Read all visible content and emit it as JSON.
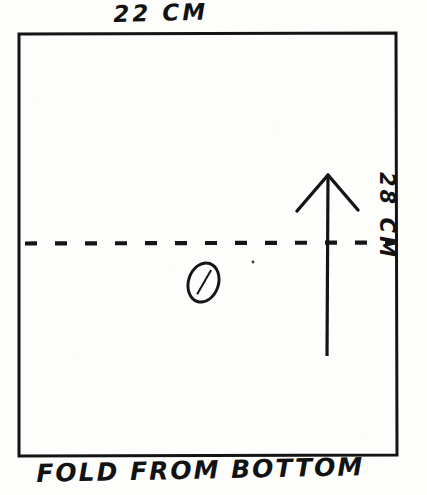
{
  "drawing": {
    "title": "Hand-drawn folding diagram of a rectangular sheet",
    "medium": "pen-on-paper sketch, scanned",
    "ink_color": "#121212",
    "paper_color": "#fdfdfc",
    "labels": {
      "top_dimension": "22 CM",
      "right_dimension": "28 CM",
      "bottom_caption": "FOLD FROM BOTTOM"
    },
    "shapes": {
      "sheet_rectangle": {
        "name": "sheet-outline",
        "x": 18,
        "y": 33,
        "width": 379,
        "height": 422,
        "stroke_width": 3
      },
      "fold_line": {
        "name": "fold-dashed-line",
        "y": 243,
        "x_start": 24,
        "x_end": 396,
        "dash": "12 18",
        "stroke_width": 4
      },
      "fold_arrow": {
        "name": "fold-direction-arrow",
        "direction": "up",
        "tip_x": 328,
        "tip_y": 174,
        "tail_y": 356,
        "head_half_width": 30,
        "head_height": 37,
        "stroke_width": 3
      },
      "center_mark": {
        "name": "slashed-oval-mark",
        "glyph": "0",
        "x": 187,
        "y": 261,
        "width": 27,
        "height": 37,
        "rotation_deg": 18
      },
      "stray_dot": {
        "name": "stray-ink-dot",
        "x": 253,
        "y": 262,
        "radius": 1.4
      }
    }
  }
}
